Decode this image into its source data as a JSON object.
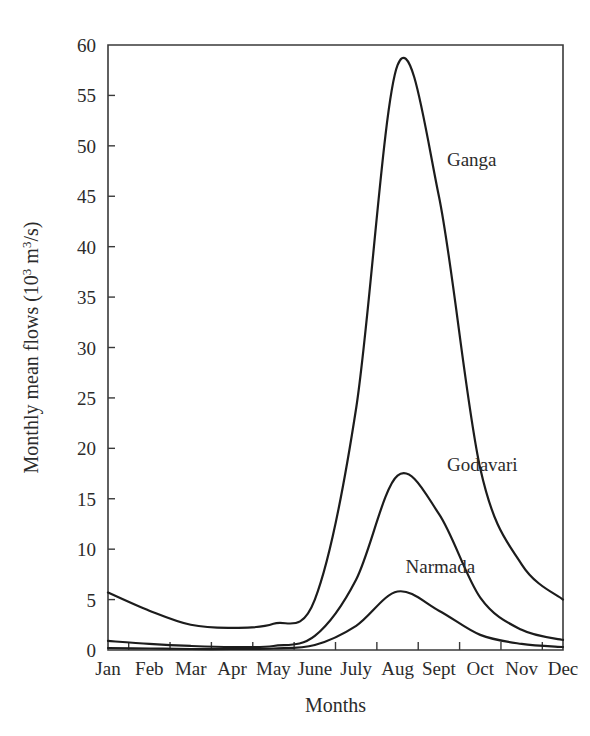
{
  "chart_data": {
    "type": "line",
    "title": "",
    "xlabel": "Months",
    "ylabel": "Monthly mean flows (10³ m³/s)",
    "ylabel_parts": {
      "text_before": "Monthly mean flows (10",
      "sup1": "3",
      "text_middle": " m",
      "sup2": "3",
      "text_after": "/s)"
    },
    "categories": [
      "Jan",
      "Feb",
      "Mar",
      "Apr",
      "May",
      "June",
      "July",
      "Aug",
      "Sept",
      "Oct",
      "Nov",
      "Dec"
    ],
    "xlim": [
      0,
      11
    ],
    "ylim": [
      0,
      60
    ],
    "yticks": [
      0,
      5,
      10,
      15,
      20,
      25,
      30,
      35,
      40,
      45,
      50,
      55,
      60
    ],
    "ytick_labels": [
      "0",
      "5",
      "10",
      "15",
      "20",
      "25",
      "30",
      "35",
      "40",
      "45",
      "50",
      "55",
      "60"
    ],
    "grid": false,
    "legend_position": "inline-annotations",
    "series": [
      {
        "name": "Ganga",
        "color": "#1c1c1c",
        "label_anchor": {
          "month": "Sept",
          "value": 48
        },
        "values": [
          5.7,
          3.9,
          2.5,
          2.2,
          2.6,
          5.0,
          24.0,
          58.0,
          45.0,
          18.0,
          8.5,
          5.0
        ]
      },
      {
        "name": "Godavari",
        "color": "#1c1c1c",
        "label_anchor": {
          "month": "Sept",
          "value": 17.8
        },
        "values": [
          0.9,
          0.6,
          0.4,
          0.3,
          0.4,
          1.4,
          7.0,
          17.3,
          13.5,
          5.2,
          2.0,
          1.0
        ]
      },
      {
        "name": "Narmada",
        "color": "#1c1c1c",
        "label_anchor": {
          "month": "Aug",
          "value": 7.6
        },
        "values": [
          0.2,
          0.15,
          0.1,
          0.1,
          0.15,
          0.5,
          2.4,
          5.8,
          3.9,
          1.5,
          0.6,
          0.3
        ]
      }
    ]
  }
}
